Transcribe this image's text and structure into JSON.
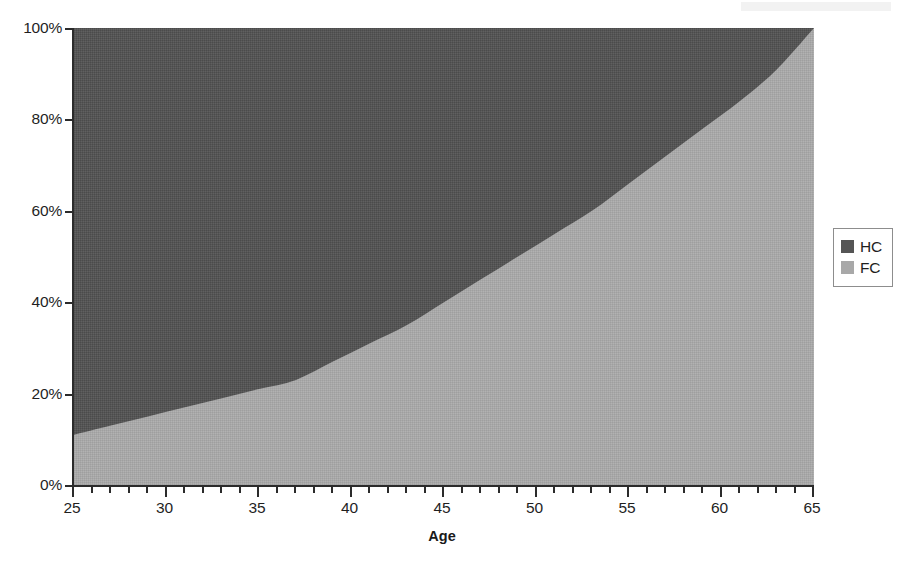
{
  "chart_data": {
    "type": "area",
    "title": "",
    "subtitle": "",
    "xlabel": "Age",
    "ylabel": "",
    "xlim": [
      25,
      65
    ],
    "ylim": [
      0,
      100
    ],
    "stacked": true,
    "percent_axis": true,
    "grid": false,
    "legend_position": "right",
    "x_tick_labels": [
      "25",
      "30",
      "35",
      "40",
      "45",
      "50",
      "55",
      "60",
      "65"
    ],
    "x_tick_values": [
      25,
      30,
      35,
      40,
      45,
      50,
      55,
      60,
      65
    ],
    "x_minor_tick_step": 1,
    "y_tick_labels": [
      "0%",
      "20%",
      "40%",
      "60%",
      "80%",
      "100%"
    ],
    "y_tick_values": [
      0,
      20,
      40,
      60,
      80,
      100
    ],
    "x": [
      25,
      27,
      29,
      31,
      33,
      35,
      37,
      39,
      41,
      43,
      45,
      47,
      49,
      51,
      53,
      55,
      57,
      59,
      61,
      63,
      65
    ],
    "series": [
      {
        "name": "HC",
        "color": "#555555",
        "values": [
          89,
          87,
          85,
          83,
          81,
          79,
          77,
          73,
          69,
          65,
          60,
          55,
          50,
          45,
          40,
          34,
          28,
          22,
          16,
          9,
          0
        ]
      },
      {
        "name": "FC",
        "color": "#a8a8a8",
        "values": [
          11,
          13,
          15,
          17,
          19,
          21,
          23,
          27,
          31,
          35,
          40,
          45,
          50,
          55,
          60,
          66,
          72,
          78,
          84,
          91,
          100
        ]
      }
    ],
    "boundary_note": "FC share rises from 11% at age 25 to 100% at age 65",
    "legend": [
      {
        "label": "HC",
        "color": "#555555"
      },
      {
        "label": "FC",
        "color": "#a8a8a8"
      }
    ]
  },
  "axes": {
    "x_title": "Age",
    "y_ticks": [
      {
        "label": "100%",
        "value": 100
      },
      {
        "label": "80%",
        "value": 80
      },
      {
        "label": "60%",
        "value": 60
      },
      {
        "label": "40%",
        "value": 40
      },
      {
        "label": "20%",
        "value": 20
      },
      {
        "label": "0%",
        "value": 0
      }
    ],
    "x_ticks": [
      {
        "label": "25",
        "value": 25
      },
      {
        "label": "30",
        "value": 30
      },
      {
        "label": "35",
        "value": 35
      },
      {
        "label": "40",
        "value": 40
      },
      {
        "label": "45",
        "value": 45
      },
      {
        "label": "50",
        "value": 50
      },
      {
        "label": "55",
        "value": 55
      },
      {
        "label": "60",
        "value": 60
      },
      {
        "label": "65",
        "value": 65
      }
    ]
  },
  "legend": {
    "items": [
      {
        "label": "HC",
        "color": "#555555"
      },
      {
        "label": "FC",
        "color": "#a8a8a8"
      }
    ]
  },
  "colors": {
    "hc": "#555555",
    "fc": "#a8a8a8",
    "axis": "#2b2b2b",
    "text": "#1f1f1f",
    "background": "#ffffff"
  }
}
